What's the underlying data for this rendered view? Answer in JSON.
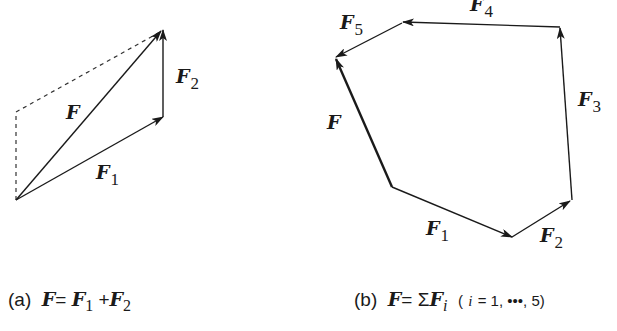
{
  "figure_a": {
    "labels": {
      "F": "F",
      "F1": "F",
      "F1_sub": "1",
      "F2": "F",
      "F2_sub": "2"
    },
    "caption": {
      "tag": "(a)",
      "lhs": "F",
      "eq": "=",
      "t1": "F",
      "t1_sub": "1",
      "plus": "+",
      "t2": "F",
      "t2_sub": "2"
    }
  },
  "figure_b": {
    "labels": {
      "F": "F",
      "F1": "F",
      "F1_sub": "1",
      "F2": "F",
      "F2_sub": "2",
      "F3": "F",
      "F3_sub": "3",
      "F4": "F",
      "F4_sub": "4",
      "F5": "F",
      "F5_sub": "5"
    },
    "caption": {
      "tag": "(b)",
      "lhs": "F",
      "eq": "=",
      "sigma": "Σ",
      "term": "F",
      "term_sub": "i",
      "range_open": "(",
      "i": "i",
      "range_rest": "= 1, •••, 5)"
    }
  },
  "colors": {
    "ink": "#1a1a1a",
    "background": "#ffffff"
  }
}
